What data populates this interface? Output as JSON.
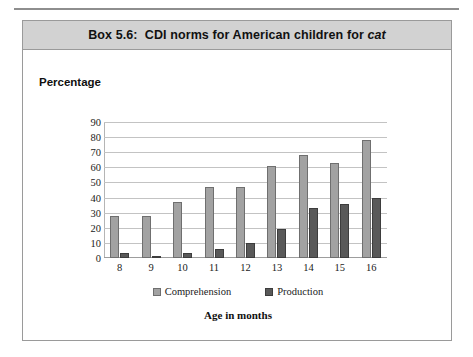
{
  "page": {
    "box_label": "Box 5.6:",
    "title_main": "CDI norms for American children for ",
    "title_italic": "cat",
    "title_full": "Box 5.6:  CDI norms for American children for cat"
  },
  "colors": {
    "comprehension": "#a2a2a2",
    "comprehension_border": "#6f6f6f",
    "production": "#595959",
    "production_border": "#3d3d3d",
    "title_banner": "#d2d2d2",
    "gridline": "#c3c3c3",
    "box_border": "#9a9a9a"
  },
  "chart_data": {
    "type": "bar",
    "xlabel": "Age in months",
    "ylabel": "Percentage",
    "categories": [
      "8",
      "9",
      "10",
      "11",
      "12",
      "13",
      "14",
      "15",
      "16"
    ],
    "series": [
      {
        "name": "Comprehension",
        "values": [
          28,
          28,
          37,
          47,
          47,
          61,
          68,
          63,
          78
        ]
      },
      {
        "name": "Production",
        "values": [
          3,
          1,
          3,
          6,
          10,
          19,
          33,
          36,
          40
        ]
      }
    ],
    "ylim": [
      0,
      90
    ],
    "yticks": [
      0,
      10,
      20,
      30,
      40,
      50,
      60,
      70,
      80,
      90
    ],
    "ytick_labels": [
      "0",
      "10",
      "20",
      "30",
      "40",
      "50",
      "60",
      "70",
      "80",
      "90"
    ],
    "grid": true,
    "legend": [
      "Comprehension",
      "Production"
    ],
    "legend_position": "bottom"
  }
}
